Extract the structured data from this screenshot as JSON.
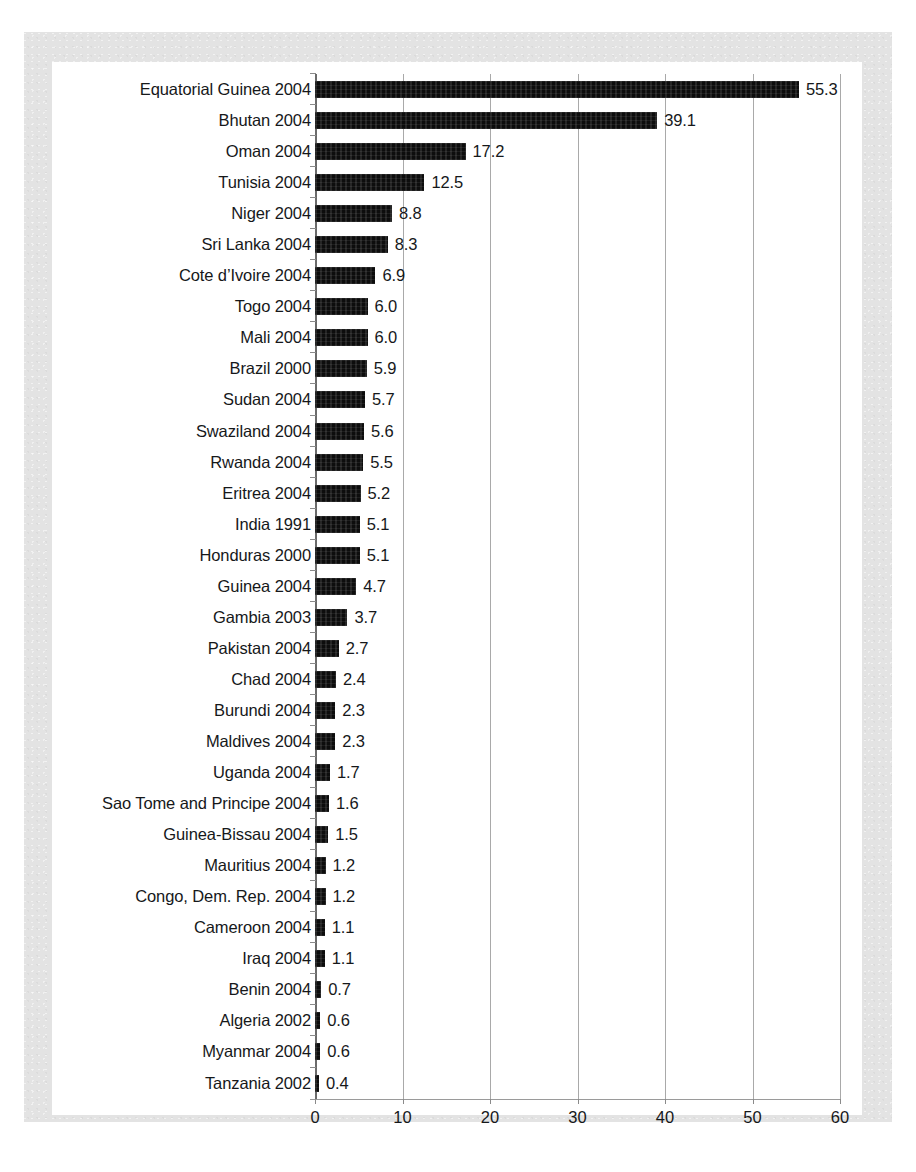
{
  "chart_data": {
    "type": "bar",
    "orientation": "horizontal",
    "title": "",
    "subtitle": "",
    "xlabel": "",
    "ylabel": "",
    "xlim": [
      0,
      60
    ],
    "x_ticks": [
      0,
      10,
      20,
      30,
      40,
      50,
      60
    ],
    "x_tick_labels": [
      "0",
      "10",
      "20",
      "30",
      "40",
      "50",
      "60"
    ],
    "grid": "vertical",
    "legend": "none",
    "bar_color": "#0d0d0d",
    "categories": [
      "Equatorial Guinea 2004",
      "Bhutan 2004",
      "Oman 2004",
      "Tunisia 2004",
      "Niger 2004",
      "Sri Lanka 2004",
      "Cote d’Ivoire 2004",
      "Togo 2004",
      "Mali 2004",
      "Brazil 2000",
      "Sudan 2004",
      "Swaziland 2004",
      "Rwanda 2004",
      "Eritrea 2004",
      "India 1991",
      "Honduras 2000",
      "Guinea 2004",
      "Gambia 2003",
      "Pakistan 2004",
      "Chad 2004",
      "Burundi 2004",
      "Maldives 2004",
      "Uganda 2004",
      "Sao Tome and Principe 2004",
      "Guinea-Bissau 2004",
      "Mauritius 2004",
      "Congo, Dem. Rep. 2004",
      "Cameroon 2004",
      "Iraq 2004",
      "Benin 2004",
      "Algeria 2002",
      "Myanmar 2004",
      "Tanzania 2002"
    ],
    "values": [
      55.3,
      39.1,
      17.2,
      12.5,
      8.8,
      8.3,
      6.9,
      6.0,
      6.0,
      5.9,
      5.7,
      5.6,
      5.5,
      5.2,
      5.1,
      5.1,
      4.7,
      3.7,
      2.7,
      2.4,
      2.3,
      2.3,
      1.7,
      1.6,
      1.5,
      1.2,
      1.2,
      1.1,
      1.1,
      0.7,
      0.6,
      0.6,
      0.4
    ],
    "value_labels": [
      "55.3",
      "39.1",
      "17.2",
      "12.5",
      "8.8",
      "8.3",
      "6.9",
      "6.0",
      "6.0",
      "5.9",
      "5.7",
      "5.6",
      "5.5",
      "5.2",
      "5.1",
      "5.1",
      "4.7",
      "3.7",
      "2.7",
      "2.4",
      "2.3",
      "2.3",
      "1.7",
      "1.6",
      "1.5",
      "1.2",
      "1.2",
      "1.1",
      "1.1",
      "0.7",
      "0.6",
      "0.6",
      "0.4"
    ]
  }
}
